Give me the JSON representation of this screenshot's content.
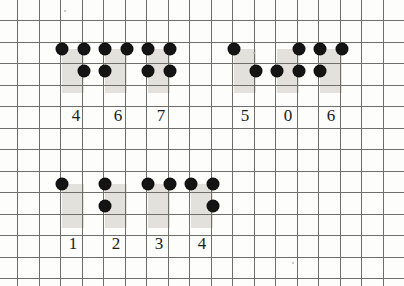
{
  "figure": {
    "kind": "dot-notation-digit-chart",
    "medium": "graph-paper",
    "colors": {
      "paper": "#fdfdfc",
      "grid_line": "#6e6f6b",
      "shaded_cell": "#e3e1dc",
      "dot": "#141414",
      "label_text": "#1b1b1b"
    },
    "grid": {
      "cell_size_px": 21.5,
      "origin_x_px": 17,
      "origin_y_px": 20,
      "columns": 18,
      "rows": 12
    }
  },
  "groups": [
    {
      "name": "top-left-group",
      "digits": [
        {
          "label": "4",
          "label_x": 65,
          "label_y": 106,
          "shade": [
            {
              "x": 62,
              "y": 49,
              "w": 22,
              "h": 22
            },
            {
              "x": 62,
              "y": 71,
              "w": 22,
              "h": 22
            }
          ],
          "dots": [
            {
              "x": 62,
              "y": 49
            },
            {
              "x": 84,
              "y": 49
            },
            {
              "x": 84,
              "y": 71
            }
          ]
        },
        {
          "label": "6",
          "label_x": 107,
          "label_y": 106,
          "shade": [
            {
              "x": 105,
              "y": 49,
              "w": 22,
              "h": 22
            },
            {
              "x": 105,
              "y": 71,
              "w": 22,
              "h": 22
            }
          ],
          "dots": [
            {
              "x": 105,
              "y": 49
            },
            {
              "x": 127,
              "y": 49
            },
            {
              "x": 105,
              "y": 71
            }
          ]
        },
        {
          "label": "7",
          "label_x": 150,
          "label_y": 106,
          "shade": [
            {
              "x": 148,
              "y": 49,
              "w": 22,
              "h": 22
            },
            {
              "x": 148,
              "y": 71,
              "w": 22,
              "h": 22
            }
          ],
          "dots": [
            {
              "x": 148,
              "y": 49
            },
            {
              "x": 170,
              "y": 49
            },
            {
              "x": 148,
              "y": 71
            },
            {
              "x": 170,
              "y": 71
            }
          ]
        }
      ]
    },
    {
      "name": "top-right-group",
      "digits": [
        {
          "label": "5",
          "label_x": 234,
          "label_y": 106,
          "shade": [
            {
              "x": 234,
              "y": 49,
              "w": 22,
              "h": 22
            },
            {
              "x": 234,
              "y": 71,
              "w": 22,
              "h": 22
            }
          ],
          "dots": [
            {
              "x": 234,
              "y": 49
            },
            {
              "x": 256,
              "y": 71
            }
          ]
        },
        {
          "label": "0",
          "label_x": 277,
          "label_y": 106,
          "shade": [
            {
              "x": 277,
              "y": 49,
              "w": 22,
              "h": 22
            },
            {
              "x": 277,
              "y": 71,
              "w": 22,
              "h": 22
            }
          ],
          "dots": [
            {
              "x": 299,
              "y": 49
            },
            {
              "x": 277,
              "y": 71
            },
            {
              "x": 299,
              "y": 71
            }
          ]
        },
        {
          "label": "6",
          "label_x": 320,
          "label_y": 106,
          "shade": [
            {
              "x": 320,
              "y": 49,
              "w": 22,
              "h": 22
            },
            {
              "x": 320,
              "y": 71,
              "w": 22,
              "h": 22
            }
          ],
          "dots": [
            {
              "x": 320,
              "y": 49
            },
            {
              "x": 342,
              "y": 49
            },
            {
              "x": 320,
              "y": 71
            }
          ]
        }
      ]
    },
    {
      "name": "bottom-group",
      "digits": [
        {
          "label": "1",
          "label_x": 62,
          "label_y": 234,
          "shade": [
            {
              "x": 62,
              "y": 184,
              "w": 22,
              "h": 22
            },
            {
              "x": 62,
              "y": 206,
              "w": 22,
              "h": 22
            }
          ],
          "dots": [
            {
              "x": 62,
              "y": 184
            }
          ]
        },
        {
          "label": "2",
          "label_x": 105,
          "label_y": 234,
          "shade": [
            {
              "x": 105,
              "y": 184,
              "w": 22,
              "h": 22
            },
            {
              "x": 105,
              "y": 206,
              "w": 22,
              "h": 22
            }
          ],
          "dots": [
            {
              "x": 105,
              "y": 184
            },
            {
              "x": 105,
              "y": 206
            }
          ]
        },
        {
          "label": "3",
          "label_x": 148,
          "label_y": 234,
          "shade": [
            {
              "x": 148,
              "y": 184,
              "w": 22,
              "h": 22
            },
            {
              "x": 148,
              "y": 206,
              "w": 22,
              "h": 22
            }
          ],
          "dots": [
            {
              "x": 148,
              "y": 184
            },
            {
              "x": 170,
              "y": 184
            }
          ]
        },
        {
          "label": "4",
          "label_x": 191,
          "label_y": 234,
          "shade": [
            {
              "x": 191,
              "y": 184,
              "w": 22,
              "h": 22
            },
            {
              "x": 191,
              "y": 206,
              "w": 22,
              "h": 22
            }
          ],
          "dots": [
            {
              "x": 191,
              "y": 184
            },
            {
              "x": 213,
              "y": 184
            },
            {
              "x": 213,
              "y": 206
            }
          ]
        }
      ]
    }
  ],
  "specks": [
    {
      "x": 253,
      "y": 52
    },
    {
      "x": 292,
      "y": 262
    },
    {
      "x": 64,
      "y": 10
    }
  ]
}
